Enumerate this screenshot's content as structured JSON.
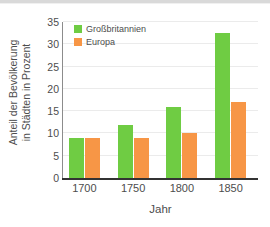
{
  "chart_data": {
    "type": "bar",
    "title": "",
    "categories": [
      "1700",
      "1750",
      "1800",
      "1850"
    ],
    "series": [
      {
        "name": "Großbritannien",
        "color": "#6fcc43",
        "values": [
          9,
          12,
          16,
          32.5
        ]
      },
      {
        "name": "Europa",
        "color": "#f79646",
        "values": [
          9,
          9,
          10,
          17
        ]
      }
    ],
    "xlabel": "Jahr",
    "ylabel": "Anteil der Bevölkerung in Städten in Prozent",
    "ylabel_lines": [
      "Anteil der Bevölkerung",
      "in Städten in Prozent"
    ],
    "ylim": [
      0,
      35
    ],
    "yticks": [
      "0",
      "5",
      "10",
      "15",
      "20",
      "25",
      "30",
      "35"
    ],
    "ytick_values": [
      0,
      5,
      10,
      15,
      20,
      25,
      30,
      35
    ],
    "grid": true,
    "legend_position": "upper left"
  }
}
